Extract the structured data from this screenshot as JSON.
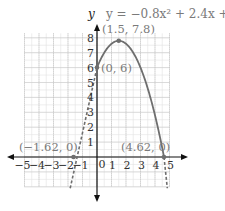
{
  "chart_data": {
    "type": "line",
    "title": "y = −0.8x² + 2.4x + 6",
    "equation": "y = −0.8x² + 2.4x + 6",
    "xlabel": "",
    "ylabel": "y",
    "xlim": [
      -5,
      5
    ],
    "ylim": [
      -2,
      8
    ],
    "grid": true,
    "x_ticks": [
      "−5",
      "−4",
      "−3",
      "−2",
      "−1",
      "0",
      "1",
      "2",
      "3",
      "4",
      "5"
    ],
    "y_ticks": [
      "1",
      "2",
      "3",
      "4",
      "5",
      "6",
      "7",
      "8"
    ],
    "series": [
      {
        "name": "y = −0.8x² + 2.4x + 6 (solid, 0 ≤ x ≤ 4.62)",
        "style": "solid",
        "x": [
          0,
          0.5,
          1,
          1.5,
          2,
          2.5,
          3,
          3.5,
          4,
          4.62
        ],
        "y": [
          6,
          7,
          7.6,
          7.8,
          7.6,
          7,
          6,
          4.6,
          2.8,
          0
        ]
      },
      {
        "name": "extension (dashed)",
        "style": "dashed",
        "x": [
          -1.8,
          -1.62,
          -1,
          -0.5,
          0,
          4.62,
          4.8
        ],
        "y": [
          -0.91,
          0,
          3.8,
          4.6,
          6,
          0,
          -1.07
        ]
      }
    ],
    "annotations": [
      {
        "label": "(1.5, 7.8)",
        "x": 1.5,
        "y": 7.8
      },
      {
        "label": "(0, 6)",
        "x": 0,
        "y": 6
      },
      {
        "label": "(−1.62, 0)",
        "x": -1.62,
        "y": 0
      },
      {
        "label": "(4.62, 0)",
        "x": 4.62,
        "y": 0
      }
    ],
    "colors": {
      "curve": "#6e6e6e",
      "axes": "#111111",
      "grid": "#bdbdbd",
      "annotation_text": "#7a7a7a",
      "tick_text": "#333333"
    }
  },
  "labels": {
    "y_axis": "y",
    "equation": "y = −0.8x² + 2.4x + 6",
    "origin": "0",
    "vertex": "(1.5, 7.8)",
    "y_intercept": "(0, 6)",
    "left_root": "(−1.62, 0)",
    "right_root": "(4.62, 0)"
  }
}
